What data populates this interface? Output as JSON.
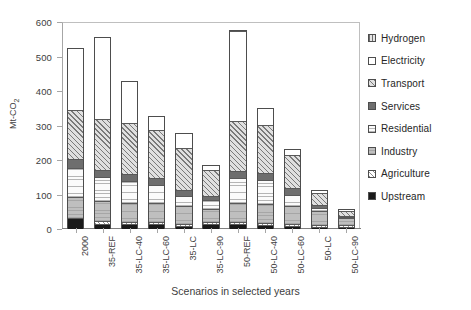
{
  "chart_data": {
    "type": "bar",
    "subtype": "stacked-bar",
    "title": "",
    "xlabel": "Scenarios in selected years",
    "ylabel": "Mt-CO2",
    "ylabel_display": "Mt-CO",
    "ylabel_sub": "2",
    "ylim": [
      0,
      600
    ],
    "yticks": [
      0,
      100,
      200,
      300,
      400,
      500,
      600
    ],
    "grid": false,
    "legend_position": "right",
    "categories": [
      "2000",
      "35-REF",
      "35-LC-40",
      "35-LC-60",
      "35-LC",
      "35-LC-90",
      "50-REF",
      "50-LC-40",
      "50-LC-60",
      "50-LC",
      "50-LC-90"
    ],
    "series": [
      {
        "name": "Upstream",
        "fill": "solid-black",
        "values": [
          28,
          13,
          12,
          12,
          7,
          11,
          11,
          10,
          6,
          3,
          2
        ]
      },
      {
        "name": "Agriculture",
        "fill": "diagonal-hatch-light",
        "values": [
          0,
          6,
          6,
          6,
          6,
          6,
          6,
          6,
          6,
          6,
          6
        ]
      },
      {
        "name": "Industry",
        "fill": "horizontal-lines-gray",
        "values": [
          62,
          59,
          54,
          54,
          51,
          40,
          57,
          55,
          53,
          43,
          22
        ]
      },
      {
        "name": "Residential",
        "fill": "horizontal-lines-white",
        "values": [
          85,
          71,
          65,
          54,
          31,
          25,
          71,
          70,
          32,
          7,
          5
        ]
      },
      {
        "name": "Services",
        "fill": "solid-dark-gray",
        "values": [
          27,
          20,
          21,
          21,
          15,
          13,
          20,
          19,
          19,
          10,
          3
        ]
      },
      {
        "name": "Transport",
        "fill": "diagonal-hatch-gray",
        "values": [
          143,
          149,
          148,
          140,
          125,
          75,
          147,
          142,
          97,
          35,
          15
        ]
      },
      {
        "name": "Electricity",
        "fill": "solid-white",
        "values": [
          180,
          239,
          123,
          40,
          43,
          17,
          262,
          48,
          20,
          10,
          4
        ]
      },
      {
        "name": "Hydrogen",
        "fill": "vertical-lines-gray",
        "values": [
          0,
          0,
          0,
          0,
          0,
          0,
          4,
          0,
          0,
          0,
          0
        ]
      }
    ],
    "totals": [
      525,
      557,
      429,
      327,
      278,
      187,
      578,
      350,
      233,
      114,
      57
    ]
  },
  "legend": {
    "items": [
      {
        "label": "Hydrogen"
      },
      {
        "label": "Electricity"
      },
      {
        "label": "Transport"
      },
      {
        "label": "Services"
      },
      {
        "label": "Residential"
      },
      {
        "label": "Industry"
      },
      {
        "label": "Agriculture"
      },
      {
        "label": "Upstream"
      }
    ]
  }
}
